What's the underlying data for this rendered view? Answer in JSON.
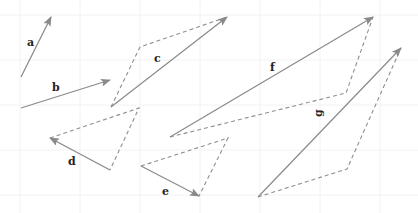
{
  "diagram": {
    "title": "",
    "colors": {
      "vector": "#8a8a8a",
      "dashed": "#8f8f8f",
      "label": "#222222",
      "background": "#ffffff"
    },
    "vectors": [
      {
        "label": "a",
        "from": [
          21,
          77
        ],
        "to": [
          51,
          17
        ],
        "label_pos": [
          27,
          46
        ]
      },
      {
        "label": "b",
        "from": [
          21,
          108
        ],
        "to": [
          110,
          80
        ],
        "label_pos": [
          52,
          91
        ]
      },
      {
        "label": "c",
        "from": [
          111,
          107
        ],
        "to": [
          227,
          17
        ],
        "label_pos": [
          154,
          62
        ],
        "dashed_path": [
          [
            111,
            107
          ],
          [
            140,
            47
          ],
          [
            227,
            17
          ]
        ]
      },
      {
        "label": "d",
        "from": [
          110,
          170
        ],
        "to": [
          50,
          138
        ],
        "label_pos": [
          68,
          165
        ],
        "dashed_path": [
          [
            50,
            138
          ],
          [
            139,
            108
          ],
          [
            110,
            170
          ]
        ]
      },
      {
        "label": "e",
        "from": [
          141,
          166
        ],
        "to": [
          199,
          196
        ],
        "label_pos": [
          162,
          195
        ],
        "dashed_path": [
          [
            141,
            166
          ],
          [
            228,
            138
          ],
          [
            199,
            196
          ]
        ]
      },
      {
        "label": "f",
        "from": [
          170,
          137
        ],
        "to": [
          373,
          17
        ],
        "label_pos": [
          270,
          71
        ],
        "dashed_path": [
          [
            170,
            137
          ],
          [
            346,
            93
          ],
          [
            373,
            17
          ]
        ]
      },
      {
        "label": "g",
        "from": [
          258,
          197
        ],
        "to": [
          401,
          48
        ],
        "label_pos": [
          322,
          117
        ],
        "dashed_path": [
          [
            258,
            197
          ],
          [
            347,
            169
          ],
          [
            401,
            48
          ]
        ],
        "label_rotated": true
      }
    ]
  }
}
